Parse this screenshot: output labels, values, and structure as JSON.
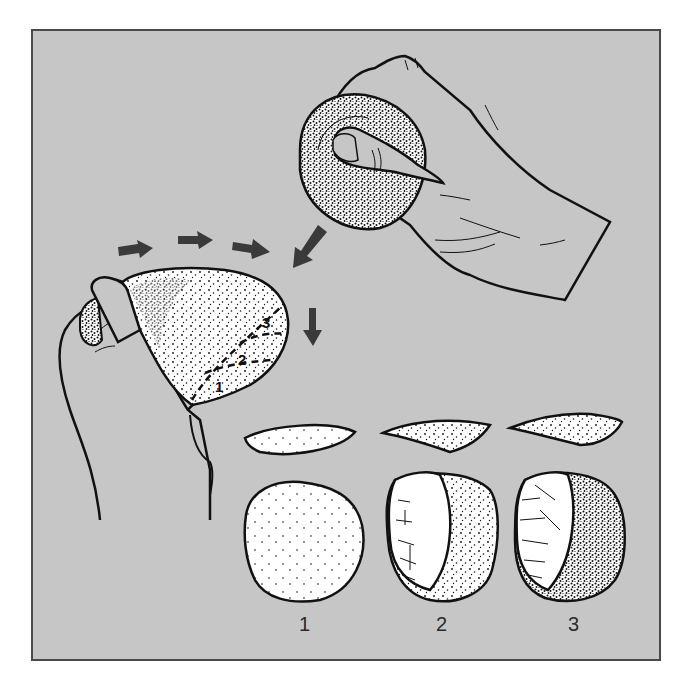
{
  "figure": {
    "type": "illustration",
    "background_color": "#c6c6c6",
    "border_color": "#4a4a4a",
    "arrow_color": "#3a3a3a",
    "stone_fill": "#ffffff",
    "stroke_color": "#111111"
  },
  "elements": {
    "hammer_hand": {
      "label": "hand-holding-hammerstone",
      "position": "top-right"
    },
    "core_hand": {
      "label": "hand-holding-core",
      "position": "left"
    },
    "motion_arrows": {
      "count": 3,
      "direction": "right"
    },
    "strike_arrow": {
      "direction": "down-left"
    },
    "result_arrow": {
      "direction": "down"
    },
    "fracture_lines": [
      {
        "number": "1"
      },
      {
        "number": "2"
      },
      {
        "number": "3"
      }
    ]
  },
  "flakes": [
    {
      "id": "1"
    },
    {
      "id": "2"
    },
    {
      "id": "3"
    }
  ],
  "cores": [
    {
      "id": "1",
      "state": "unworked"
    },
    {
      "id": "2",
      "state": "one flake scar"
    },
    {
      "id": "3",
      "state": "flake scars"
    }
  ],
  "labels": {
    "step1": "1",
    "step2": "2",
    "step3": "3",
    "core_line1": "1",
    "core_line2": "2",
    "core_line3": "3"
  }
}
